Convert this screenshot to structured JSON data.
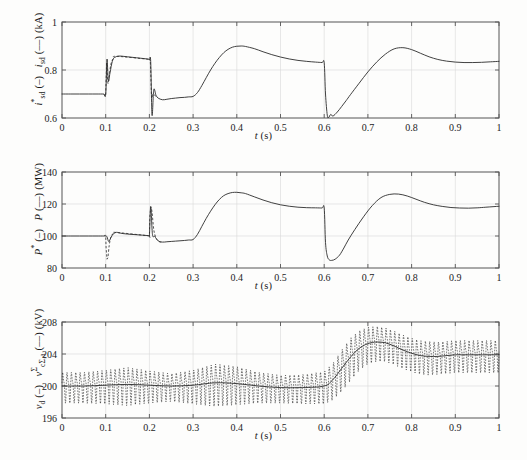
{
  "figure": {
    "background": "#fdfdfc",
    "axis_color": "#555555",
    "curve_color": "#2b2b2b",
    "grid_color": "#d8d8d8"
  },
  "chart_data": [
    {
      "type": "line",
      "panel_index": 0,
      "title": "",
      "xlabel": "t (s)",
      "ylabel": "i*sd (–)   isd (– –)  (kA)",
      "ylabel_parts": {
        "sym1": "i",
        "sup1": "*",
        "sub1": "sd",
        "legend1": "(–)",
        "sym2": "i",
        "sub2": "sd",
        "legend2": "(– –)",
        "unit": "(kA)"
      },
      "xlim": [
        0,
        1
      ],
      "ylim": [
        0.6,
        1.0
      ],
      "xticks": [
        0,
        0.1,
        0.2,
        0.3,
        0.4,
        0.5,
        0.6,
        0.7,
        0.8,
        0.9,
        1
      ],
      "xticklabels": [
        "0",
        "0.1",
        "0.2",
        "0.3",
        "0.4",
        "0.5",
        "0.6",
        "0.7",
        "0.8",
        "0.9",
        "1"
      ],
      "yticks": [
        0.6,
        0.8,
        1
      ],
      "yticklabels": [
        "0.6",
        "0.8",
        "1"
      ],
      "grid": true,
      "legend": [
        "i*sd (–)",
        "isd (– –)"
      ],
      "series": [
        {
          "name": "i_sd reference and measured (kA)",
          "style": "solid",
          "x": [
            0,
            0.02,
            0.04,
            0.06,
            0.08,
            0.095,
            0.1,
            0.103,
            0.106,
            0.11,
            0.115,
            0.12,
            0.13,
            0.14,
            0.15,
            0.16,
            0.17,
            0.18,
            0.19,
            0.198,
            0.2,
            0.203,
            0.206,
            0.21,
            0.215,
            0.22,
            0.23,
            0.24,
            0.25,
            0.26,
            0.27,
            0.28,
            0.29,
            0.3,
            0.31,
            0.32,
            0.33,
            0.34,
            0.35,
            0.36,
            0.37,
            0.38,
            0.39,
            0.4,
            0.41,
            0.42,
            0.44,
            0.46,
            0.48,
            0.5,
            0.52,
            0.54,
            0.56,
            0.58,
            0.595,
            0.6,
            0.603,
            0.607,
            0.61,
            0.615,
            0.62,
            0.63,
            0.64,
            0.65,
            0.66,
            0.68,
            0.7,
            0.72,
            0.74,
            0.76,
            0.78,
            0.8,
            0.82,
            0.84,
            0.86,
            0.88,
            0.9,
            0.92,
            0.94,
            0.96,
            0.98,
            1.0
          ],
          "y": [
            0.7,
            0.7,
            0.7,
            0.7,
            0.7,
            0.7,
            0.7,
            0.845,
            0.755,
            0.79,
            0.835,
            0.852,
            0.858,
            0.857,
            0.855,
            0.853,
            0.851,
            0.849,
            0.847,
            0.845,
            0.843,
            0.835,
            0.612,
            0.718,
            0.695,
            0.683,
            0.676,
            0.678,
            0.681,
            0.683,
            0.685,
            0.686,
            0.688,
            0.69,
            0.706,
            0.735,
            0.768,
            0.8,
            0.828,
            0.852,
            0.872,
            0.886,
            0.895,
            0.899,
            0.9,
            0.898,
            0.889,
            0.876,
            0.864,
            0.854,
            0.846,
            0.84,
            0.836,
            0.833,
            0.831,
            0.83,
            0.7,
            0.612,
            0.602,
            0.615,
            0.608,
            0.625,
            0.648,
            0.672,
            0.697,
            0.745,
            0.792,
            0.833,
            0.866,
            0.888,
            0.893,
            0.885,
            0.87,
            0.855,
            0.844,
            0.837,
            0.833,
            0.831,
            0.831,
            0.832,
            0.834,
            0.836
          ]
        },
        {
          "name": "i_sd measured transient detail (dashed)",
          "style": "dashed",
          "x": [
            0.096,
            0.1,
            0.102,
            0.105,
            0.108,
            0.112,
            0.118,
            0.125,
            0.196,
            0.2,
            0.202,
            0.205,
            0.208,
            0.212,
            0.218
          ],
          "y": [
            0.7,
            0.7,
            0.83,
            0.745,
            0.775,
            0.825,
            0.849,
            0.857,
            0.845,
            0.843,
            0.84,
            0.69,
            0.7,
            0.695,
            0.686
          ]
        }
      ]
    },
    {
      "type": "line",
      "panel_index": 1,
      "title": "",
      "xlabel": "t (s)",
      "ylabel": "P* (–)   P (– –)  (MW)",
      "ylabel_parts": {
        "sym1": "P",
        "sup1": "*",
        "legend1": "(–)",
        "sym2": "P",
        "legend2": "(– –)",
        "unit": "(MW)"
      },
      "xlim": [
        0,
        1
      ],
      "ylim": [
        80,
        140
      ],
      "xticks": [
        0,
        0.1,
        0.2,
        0.3,
        0.4,
        0.5,
        0.6,
        0.7,
        0.8,
        0.9,
        1
      ],
      "xticklabels": [
        "0",
        "0.1",
        "0.2",
        "0.3",
        "0.4",
        "0.5",
        "0.6",
        "0.7",
        "0.8",
        "0.9",
        "1"
      ],
      "yticks": [
        80,
        100,
        120,
        140
      ],
      "yticklabels": [
        "80",
        "100",
        "120",
        "140"
      ],
      "grid": true,
      "legend": [
        "P* (–)",
        "P (– –)"
      ],
      "series": [
        {
          "name": "Active power reference and measured (MW)",
          "style": "solid",
          "x": [
            0,
            0.02,
            0.04,
            0.06,
            0.08,
            0.095,
            0.1,
            0.103,
            0.107,
            0.112,
            0.118,
            0.125,
            0.13,
            0.14,
            0.15,
            0.16,
            0.17,
            0.18,
            0.19,
            0.198,
            0.2,
            0.203,
            0.207,
            0.212,
            0.22,
            0.23,
            0.24,
            0.25,
            0.26,
            0.27,
            0.28,
            0.29,
            0.3,
            0.31,
            0.32,
            0.33,
            0.34,
            0.35,
            0.36,
            0.37,
            0.38,
            0.39,
            0.4,
            0.41,
            0.42,
            0.44,
            0.46,
            0.48,
            0.5,
            0.52,
            0.54,
            0.56,
            0.58,
            0.595,
            0.6,
            0.603,
            0.607,
            0.612,
            0.618,
            0.625,
            0.635,
            0.645,
            0.655,
            0.67,
            0.69,
            0.71,
            0.73,
            0.75,
            0.77,
            0.79,
            0.81,
            0.83,
            0.85,
            0.87,
            0.89,
            0.91,
            0.93,
            0.95,
            0.97,
            1.0
          ],
          "y": [
            100,
            100,
            100,
            100,
            100,
            100,
            100,
            99.5,
            96.5,
            99.0,
            101.5,
            102.3,
            102.0,
            101.5,
            101.2,
            101.0,
            100.8,
            100.6,
            100.4,
            100.2,
            100.0,
            118.5,
            101.0,
            99.8,
            97.0,
            96.2,
            96.4,
            96.6,
            96.8,
            97.0,
            97.2,
            97.5,
            97.8,
            101.0,
            106.0,
            111.0,
            115.5,
            119.5,
            122.8,
            125.2,
            126.5,
            127.2,
            127.3,
            127.0,
            126.5,
            124.5,
            122.5,
            120.8,
            119.5,
            118.6,
            118.0,
            117.7,
            117.6,
            117.5,
            117.5,
            96.0,
            87.5,
            85.0,
            84.8,
            85.5,
            88.0,
            92.5,
            97.5,
            104.0,
            112.0,
            119.0,
            124.0,
            126.0,
            126.2,
            125.0,
            123.0,
            121.0,
            119.5,
            118.5,
            117.8,
            117.5,
            117.4,
            117.6,
            118.0,
            118.6
          ]
        },
        {
          "name": "P measured transient detail (dashed)",
          "style": "dashed",
          "x": [
            0.096,
            0.1,
            0.101,
            0.103,
            0.105,
            0.108,
            0.112,
            0.118,
            0.125,
            0.196,
            0.2,
            0.201,
            0.203,
            0.206,
            0.21,
            0.215,
            0.222,
            0.23
          ],
          "y": [
            100,
            100,
            92.0,
            85.5,
            86.5,
            94.0,
            99.5,
            101.8,
            102.2,
            100.2,
            100.0,
            112.0,
            118.0,
            115.0,
            104.0,
            99.0,
            96.5,
            96.2
          ]
        }
      ]
    },
    {
      "type": "line",
      "panel_index": 2,
      "title": "",
      "xlabel": "t (s)",
      "ylabel": "vd (–)   vΣcΣ,a (– –)  (kV)",
      "ylabel_parts": {
        "sym1": "v",
        "sub1": "d",
        "legend1": "(–)",
        "sym2": "v",
        "sup2": "Σ",
        "sub2": "cΣ,a",
        "legend2": "(– –)",
        "unit": "(kV)"
      },
      "xlim": [
        0,
        1
      ],
      "ylim": [
        196,
        208
      ],
      "xticks": [
        0,
        0.1,
        0.2,
        0.3,
        0.4,
        0.5,
        0.6,
        0.7,
        0.8,
        0.9,
        1
      ],
      "xticklabels": [
        "0",
        "0.1",
        "0.2",
        "0.3",
        "0.4",
        "0.5",
        "0.6",
        "0.7",
        "0.8",
        "0.9",
        "1"
      ],
      "yticks": [
        196,
        200,
        204,
        208
      ],
      "yticklabels": [
        "196",
        "200",
        "204",
        "208"
      ],
      "grid": true,
      "legend": [
        "vd (–)",
        "vΣcΣ,a (– –)"
      ],
      "series": [
        {
          "name": "v_d DC-link mean voltage (kV)",
          "style": "solid",
          "x": [
            0,
            0.05,
            0.1,
            0.15,
            0.2,
            0.25,
            0.3,
            0.35,
            0.4,
            0.45,
            0.5,
            0.55,
            0.6,
            0.62,
            0.64,
            0.66,
            0.68,
            0.7,
            0.72,
            0.74,
            0.76,
            0.78,
            0.8,
            0.82,
            0.84,
            0.86,
            0.88,
            0.9,
            0.92,
            0.95,
            1.0
          ],
          "y": [
            200.0,
            200.0,
            200.1,
            200.2,
            200.1,
            200.0,
            200.1,
            200.4,
            200.3,
            200.0,
            199.8,
            199.8,
            200.0,
            200.8,
            202.2,
            203.6,
            204.7,
            205.3,
            205.5,
            205.4,
            205.0,
            204.5,
            204.1,
            203.8,
            203.7,
            203.7,
            203.8,
            203.9,
            203.9,
            203.9,
            203.9
          ]
        },
        {
          "name": "v^Σ_cΣ,a arm capacitor voltage sum with ripple (kV, dashed envelope)",
          "style": "ripple",
          "ripple_frequency_hz": 100,
          "ripple_amplitude": [
            2.1,
            2.1,
            2.3,
            2.6,
            2.2,
            1.9,
            2.3,
            2.9,
            2.6,
            2.1,
            1.9,
            2.0,
            2.2,
            2.5,
            2.8,
            2.9,
            2.7,
            2.5,
            2.4,
            2.3,
            2.3,
            2.3,
            2.3,
            2.3,
            2.3,
            2.2,
            2.2,
            2.2,
            2.2,
            2.2,
            2.2
          ],
          "x": [
            0,
            0.05,
            0.1,
            0.15,
            0.2,
            0.25,
            0.3,
            0.35,
            0.4,
            0.45,
            0.5,
            0.55,
            0.6,
            0.62,
            0.64,
            0.66,
            0.68,
            0.7,
            0.72,
            0.74,
            0.76,
            0.78,
            0.8,
            0.82,
            0.84,
            0.86,
            0.88,
            0.9,
            0.92,
            0.95,
            1.0
          ],
          "y": [
            200.0,
            200.0,
            200.1,
            200.2,
            200.1,
            200.0,
            200.1,
            200.4,
            200.3,
            200.0,
            199.8,
            199.8,
            200.0,
            200.8,
            202.2,
            203.6,
            204.7,
            205.3,
            205.5,
            205.4,
            205.0,
            204.5,
            204.1,
            203.8,
            203.7,
            203.7,
            203.8,
            203.9,
            203.9,
            203.9,
            203.9
          ]
        }
      ]
    }
  ]
}
